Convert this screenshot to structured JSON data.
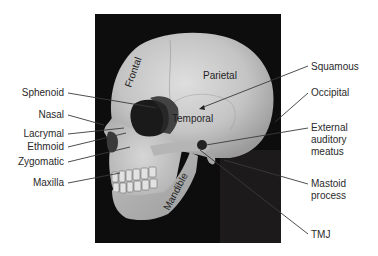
{
  "figure": {
    "background_color": "#ffffff",
    "photo_background_color": "#0d0d0d",
    "bone_color": "#c9c9c9"
  },
  "bone_labels": {
    "frontal": "Frontal",
    "parietal": "Parietal",
    "temporal": "Temporal",
    "mandible": "Mandible"
  },
  "left_labels": [
    {
      "id": "sphenoid",
      "text": "Sphenoid"
    },
    {
      "id": "nasal",
      "text": "Nasal"
    },
    {
      "id": "lacrymal",
      "text": "Lacrymal"
    },
    {
      "id": "ethmoid",
      "text": "Ethmoid"
    },
    {
      "id": "zygomatic",
      "text": "Zygomatic"
    },
    {
      "id": "maxilla",
      "text": "Maxilla"
    }
  ],
  "right_labels": [
    {
      "id": "squamous",
      "lines": [
        "Squamous"
      ]
    },
    {
      "id": "occipital",
      "lines": [
        "Occipital"
      ]
    },
    {
      "id": "external-auditory-meatus",
      "lines": [
        "External",
        "auditory",
        "meatus"
      ]
    },
    {
      "id": "mastoid-process",
      "lines": [
        "Mastoid",
        "process"
      ]
    },
    {
      "id": "tmj",
      "lines": [
        "TMJ"
      ]
    }
  ]
}
